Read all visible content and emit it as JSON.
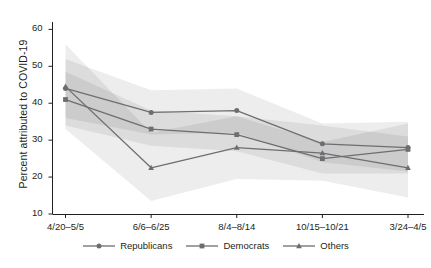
{
  "chart_data": {
    "type": "line",
    "title": "",
    "xlabel": "",
    "ylabel": "Percent attributed to COVID-19",
    "categories": [
      "4/20–5/5",
      "6/6–6/25",
      "8/4–8/14",
      "10/15–10/21",
      "3/24–4/5"
    ],
    "ylim": [
      10,
      62
    ],
    "yticks": [
      10,
      20,
      30,
      40,
      50,
      60
    ],
    "ytick_labels": [
      "10",
      "20",
      "30",
      "40",
      "50",
      "60"
    ],
    "grid": false,
    "legend_position": "bottom-center",
    "series": [
      {
        "name": "Republicans",
        "marker": "circle",
        "color": "#6d6e71",
        "values": [
          44.0,
          37.5,
          38.0,
          29.0,
          28.0
        ],
        "ci_low": [
          36.0,
          31.5,
          32.0,
          24.0,
          21.5
        ],
        "ci_high": [
          52.0,
          43.5,
          44.0,
          34.5,
          35.0
        ]
      },
      {
        "name": "Democrats",
        "marker": "square",
        "color": "#6d6e71",
        "values": [
          41.0,
          33.0,
          31.5,
          25.0,
          27.5
        ],
        "ci_low": [
          34.0,
          28.5,
          27.0,
          21.0,
          21.0
        ],
        "ci_high": [
          48.5,
          38.0,
          36.5,
          29.5,
          34.5
        ]
      },
      {
        "name": "Others",
        "marker": "triangle",
        "color": "#6d6e71",
        "values": [
          44.5,
          22.5,
          28.0,
          26.5,
          22.5
        ],
        "ci_low": [
          33.0,
          13.5,
          19.5,
          19.0,
          14.5
        ],
        "ci_high": [
          56.0,
          32.0,
          36.5,
          34.0,
          31.0
        ]
      }
    ]
  },
  "axis": {
    "y_title": "Percent attributed to COVID-19"
  },
  "legend": {
    "items": [
      {
        "label": "Republicans",
        "marker": "circle-marker-icon"
      },
      {
        "label": "Democrats",
        "marker": "square-marker-icon"
      },
      {
        "label": "Others",
        "marker": "triangle-marker-icon"
      }
    ]
  },
  "colors": {
    "line": "#6d6e71",
    "band": "#000000",
    "axis": "#231f20",
    "text": "#231f20",
    "background": "#ffffff"
  }
}
